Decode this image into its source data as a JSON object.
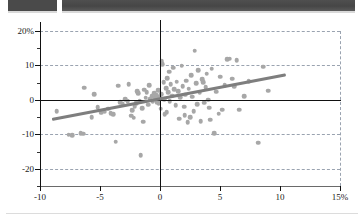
{
  "header": {
    "bars": [
      {
        "name": "redacted-block-left",
        "label": ""
      },
      {
        "name": "redacted-block-right",
        "label": ""
      }
    ]
  },
  "colors": {
    "dot": "#a7a7a7",
    "trend_line": "#7e7e7e",
    "axis": "#111111",
    "grid": "#9aa3b0",
    "header_bar": "#4a4a4a"
  },
  "chart_data": {
    "type": "scatter",
    "title": "",
    "subtitle": "",
    "xlabel": "",
    "ylabel": "",
    "xlim": [
      -10,
      15
    ],
    "ylim": [
      -25,
      20
    ],
    "xticks": [
      -10,
      -5,
      0,
      5,
      10,
      15
    ],
    "xticklabels": [
      "-10",
      "-5",
      "0",
      "5",
      "10",
      "15%"
    ],
    "yticks": [
      20,
      10,
      0,
      -10,
      -20
    ],
    "yticklabels": [
      "20%",
      "10",
      "0",
      "-10",
      "-20"
    ],
    "grid": true,
    "gridlines_y": [
      20,
      10,
      -10,
      -20
    ],
    "gridlines_x": [
      15
    ],
    "legend": null,
    "zero_lines": {
      "x": 0,
      "y": 0
    },
    "series": [
      {
        "name": "observations",
        "marker": "circle",
        "color": "#a7a7a7",
        "points": [
          [
            -8.6,
            -3.3
          ],
          [
            -7.6,
            -10.1
          ],
          [
            -7.3,
            -10.2
          ],
          [
            -6.6,
            -9.6
          ],
          [
            -6.4,
            -9.8
          ],
          [
            -6.3,
            3.5
          ],
          [
            -5.7,
            -5.1
          ],
          [
            -5.5,
            1.6
          ],
          [
            -5.2,
            -2.2
          ],
          [
            -4.9,
            -3.7
          ],
          [
            -4.6,
            -3.4
          ],
          [
            -4.3,
            -2.6
          ],
          [
            -4.1,
            -3.9
          ],
          [
            -3.9,
            -4.1
          ],
          [
            -3.7,
            -12.1
          ],
          [
            -3.5,
            4.1
          ],
          [
            -3.3,
            -0.6
          ],
          [
            -3.1,
            -1.1
          ],
          [
            -2.9,
            0.2
          ],
          [
            -2.7,
            -0.3
          ],
          [
            -2.6,
            4.5
          ],
          [
            -2.4,
            -4.6
          ],
          [
            -2.3,
            -3.0
          ],
          [
            -2.2,
            -5.2
          ],
          [
            -2.1,
            -1.8
          ],
          [
            -2.0,
            -0.9
          ],
          [
            -1.9,
            2.6
          ],
          [
            -1.8,
            1.9
          ],
          [
            -1.7,
            -0.2
          ],
          [
            -1.6,
            -16.0
          ],
          [
            -1.5,
            -2.4
          ],
          [
            -1.4,
            -6.3
          ],
          [
            -1.3,
            3.0
          ],
          [
            -1.2,
            0.6
          ],
          [
            -1.1,
            2.2
          ],
          [
            -1.0,
            -1.4
          ],
          [
            -0.9,
            4.2
          ],
          [
            -0.8,
            0.4
          ],
          [
            -0.7,
            1.1
          ],
          [
            -0.6,
            -0.5
          ],
          [
            -0.5,
            2.0
          ],
          [
            -0.4,
            0.8
          ],
          [
            -0.35,
            0.1
          ],
          [
            -0.3,
            1.4
          ],
          [
            -0.25,
            -0.7
          ],
          [
            -0.2,
            0.5
          ],
          [
            -0.15,
            2.8
          ],
          [
            -0.1,
            -1.0
          ],
          [
            -0.05,
            0.9
          ],
          [
            0.0,
            0.3
          ],
          [
            0.05,
            -2.6
          ],
          [
            0.1,
            1.7
          ],
          [
            0.15,
            11.3
          ],
          [
            0.2,
            10.4
          ],
          [
            0.3,
            5.2
          ],
          [
            0.35,
            0.2
          ],
          [
            0.4,
            -4.2
          ],
          [
            0.5,
            3.4
          ],
          [
            0.55,
            -3.6
          ],
          [
            0.6,
            6.3
          ],
          [
            0.7,
            2.3
          ],
          [
            0.75,
            8.2
          ],
          [
            0.8,
            -0.4
          ],
          [
            0.9,
            4.6
          ],
          [
            1.0,
            1.2
          ],
          [
            1.1,
            9.4
          ],
          [
            1.2,
            3.1
          ],
          [
            1.3,
            -1.6
          ],
          [
            1.4,
            5.3
          ],
          [
            1.5,
            2.6
          ],
          [
            1.6,
            -5.5
          ],
          [
            1.7,
            0.7
          ],
          [
            1.8,
            9.9
          ],
          [
            1.9,
            4.0
          ],
          [
            2.0,
            -2.0
          ],
          [
            2.05,
            -4.4
          ],
          [
            2.1,
            1.5
          ],
          [
            2.2,
            5.6
          ],
          [
            2.3,
            -6.4
          ],
          [
            2.4,
            3.3
          ],
          [
            2.5,
            -5.0
          ],
          [
            2.6,
            7.1
          ],
          [
            2.7,
            0.9
          ],
          [
            2.8,
            -3.2
          ],
          [
            2.9,
            14.3
          ],
          [
            3.0,
            4.8
          ],
          [
            3.1,
            -1.2
          ],
          [
            3.2,
            8.7
          ],
          [
            3.3,
            2.1
          ],
          [
            3.4,
            -6.2
          ],
          [
            3.5,
            6.0
          ],
          [
            3.6,
            5.1
          ],
          [
            3.7,
            -0.8
          ],
          [
            3.8,
            3.7
          ],
          [
            3.9,
            7.6
          ],
          [
            4.0,
            0.1
          ],
          [
            4.1,
            -2.3
          ],
          [
            4.2,
            -5.8
          ],
          [
            4.3,
            9.0
          ],
          [
            4.5,
            -9.6
          ],
          [
            4.7,
            2.4
          ],
          [
            4.9,
            -4.0
          ],
          [
            5.0,
            6.7
          ],
          [
            5.2,
            -2.9
          ],
          [
            5.4,
            4.3
          ],
          [
            5.6,
            11.8
          ],
          [
            5.8,
            12.0
          ],
          [
            6.0,
            6.1
          ],
          [
            6.2,
            3.9
          ],
          [
            6.4,
            11.5
          ],
          [
            6.6,
            -2.8
          ],
          [
            7.0,
            1.0
          ],
          [
            7.4,
            5.4
          ],
          [
            8.2,
            -12.4
          ],
          [
            8.6,
            9.6
          ],
          [
            9.0,
            2.7
          ]
        ]
      }
    ],
    "trendline": {
      "name": "fitted-regression-line",
      "color": "#7e7e7e",
      "from": [
        -9.0,
        -5.5
      ],
      "to": [
        10.5,
        7.5
      ]
    }
  }
}
